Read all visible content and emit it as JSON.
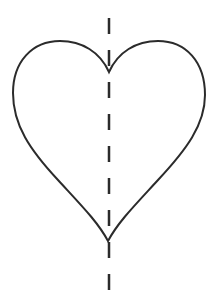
{
  "diagram": {
    "type": "line-of-symmetry",
    "shape": "heart",
    "canvas": {
      "width": 214,
      "height": 303,
      "background": "#ffffff"
    },
    "outline": {
      "stroke": "#2b2b2b",
      "stroke_width": 2,
      "fill": "none",
      "points": {
        "top_cusp": [
          109,
          72
        ],
        "left_lobe_top": [
          60,
          41
        ],
        "left_edge": [
          13,
          93
        ],
        "right_lobe_top": [
          158,
          41
        ],
        "right_edge": [
          205,
          95
        ],
        "bottom_tip": [
          108,
          241
        ]
      }
    },
    "symmetry_line": {
      "style": "dashed",
      "stroke": "#2b2b2b",
      "stroke_width": 2.5,
      "x": 109,
      "y_start": 18,
      "y_end": 291,
      "dash_length": 16,
      "gap_length": 16
    }
  }
}
